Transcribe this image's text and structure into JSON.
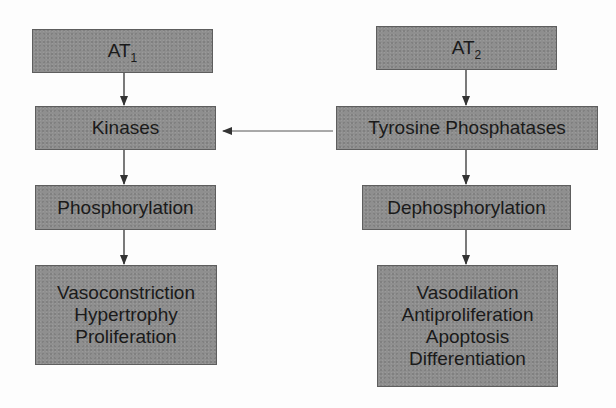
{
  "diagram": {
    "left_column": {
      "receptor": {
        "label": "AT",
        "subscript": "1"
      },
      "enzyme": {
        "label": "Kinases"
      },
      "process": {
        "label": "Phosphorylation"
      },
      "effects": {
        "lines": [
          "Vasoconstriction",
          "Hypertrophy",
          "Proliferation"
        ]
      }
    },
    "right_column": {
      "receptor": {
        "label": "AT",
        "subscript": "2"
      },
      "enzyme": {
        "label": "Tyrosine Phosphatases"
      },
      "process": {
        "label": "Dephosphorylation"
      },
      "effects": {
        "lines": [
          "Vasodilation",
          "Antiproliferation",
          "Apoptosis",
          "Differentiation"
        ]
      }
    },
    "cross_link": {
      "from": "Tyrosine Phosphatases",
      "to": "Kinases",
      "type": "inhibitory-arrow"
    },
    "colors": {
      "box_fill": "#8f8f8f",
      "box_border": "#5e5e5e",
      "text": "#1a1a1a",
      "arrow": "#333333",
      "background": "#fdfdfd"
    }
  }
}
